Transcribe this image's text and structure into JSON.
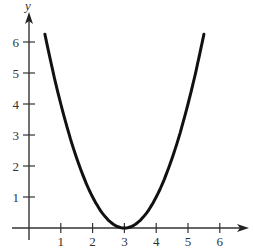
{
  "chart_data": {
    "type": "line",
    "title": "",
    "xlabel": "",
    "ylabel": "y",
    "function": "y = (x - 3)^2",
    "x": [
      0.5,
      1.0,
      1.5,
      2.0,
      2.5,
      3.0,
      3.5,
      4.0,
      4.5,
      5.0,
      5.5
    ],
    "series": [
      {
        "name": "parabola",
        "values": [
          6.25,
          4.0,
          2.25,
          1.0,
          0.25,
          0.0,
          0.25,
          1.0,
          2.25,
          4.0,
          6.25
        ]
      }
    ],
    "xticks": [
      "1",
      "2",
      "3",
      "4",
      "5",
      "6"
    ],
    "yticks": [
      "1",
      "2",
      "3",
      "4",
      "5",
      "6"
    ],
    "xlim": [
      -0.3,
      6.8
    ],
    "ylim": [
      -0.6,
      7.0
    ],
    "grid": false,
    "legend": null,
    "line_color": "#111111"
  }
}
